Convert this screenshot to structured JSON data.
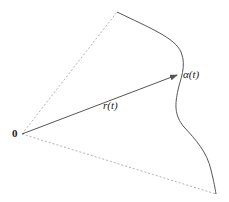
{
  "diagram": {
    "origin_label": "0",
    "vector_label": "r(t)",
    "curve_point_label": "α(t)",
    "colors": {
      "curve": "#555555",
      "dashed": "#999999",
      "arrow": "#555555",
      "text": "#222222"
    }
  }
}
